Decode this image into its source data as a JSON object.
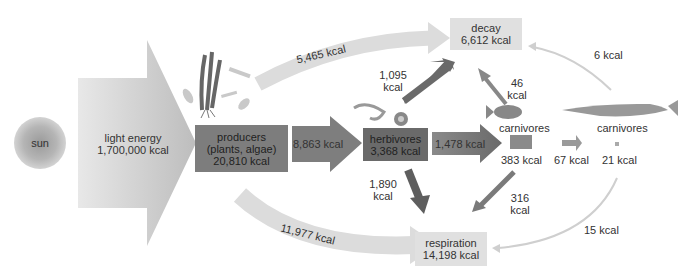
{
  "diagram": {
    "sun": {
      "label": "sun"
    },
    "light": {
      "line1": "light energy",
      "line2": "1,700,000 kcal"
    },
    "producers": {
      "line1": "producers",
      "line2": "(plants, algae)",
      "line3": "20,810 kcal"
    },
    "herbivores": {
      "line1": "herbivores",
      "line2": "3,368 kcal"
    },
    "carnivores1": {
      "label": "carnivores",
      "value": "383 kcal"
    },
    "carnivores2": {
      "label": "carnivores",
      "value": "21 kcal"
    },
    "decay": {
      "line1": "decay",
      "line2": "6,612 kcal"
    },
    "respiration": {
      "line1": "respiration",
      "line2": "14,198 kcal"
    },
    "flows": {
      "producers_to_herbivores": "8,863 kcal",
      "herbivores_to_carnivores": "1,478 kcal",
      "carnivores_to_carnivores": "67 kcal",
      "producers_to_decay": "5,465 kcal",
      "producers_to_respiration": "11,977 kcal",
      "herbivores_to_decay_1": "1,095",
      "herbivores_to_decay_2": "kcal",
      "herbivores_to_respiration_1": "1,890",
      "herbivores_to_respiration_2": "kcal",
      "carnivores_to_decay_1": "46",
      "carnivores_to_decay_2": "kcal",
      "carnivores_to_respiration_1": "316",
      "carnivores_to_respiration_2": "kcal",
      "top_carnivores_to_decay": "6 kcal",
      "top_carnivores_to_respiration": "15 kcal"
    },
    "colors": {
      "light_arrow": "#cfcfcf",
      "producers_box": "#7d7d7d",
      "herbivores_box": "#6a6a6a",
      "decay_box": "#e0e0e0",
      "respiration_box": "#e0e0e0",
      "pale_arrow": "#dcdcdc",
      "dark_arrow": "#5e5e5e"
    }
  }
}
